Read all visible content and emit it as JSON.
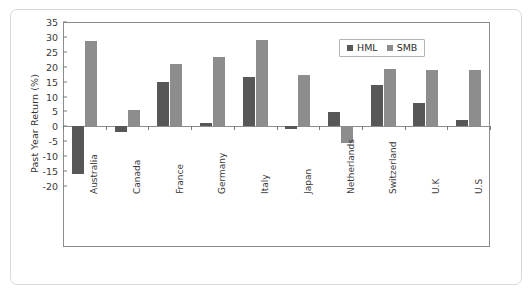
{
  "chart_data": {
    "type": "bar",
    "title": "",
    "xlabel": "",
    "ylabel": "Past Year Return (%)",
    "ylim": [
      -20,
      35
    ],
    "ytick_step": 5,
    "yticks": [
      35,
      30,
      25,
      20,
      15,
      10,
      5,
      0,
      -5,
      -10,
      -15,
      -20
    ],
    "grid": false,
    "legend_position": "top-right",
    "categories": [
      "Australia",
      "Canada",
      "France",
      "Germany",
      "Italy",
      "Japan",
      "Netherlands",
      "Switzerland",
      "U.K",
      "U.S"
    ],
    "series": [
      {
        "name": "HML",
        "color": "#575757",
        "values": [
          -16.1,
          -2.0,
          14.8,
          1.0,
          16.6,
          -1.0,
          4.7,
          14.0,
          8.0,
          2.3
        ]
      },
      {
        "name": "SMB",
        "color": "#8d8d8d",
        "values": [
          28.7,
          5.6,
          20.8,
          23.4,
          28.8,
          17.3,
          -5.5,
          19.3,
          19.0,
          19.0
        ]
      }
    ]
  },
  "legend": {
    "entries": [
      {
        "label": "HML"
      },
      {
        "label": "SMB"
      }
    ]
  },
  "colors": {
    "hml": "#575757",
    "smb": "#8d8d8d",
    "axis": "#8d8d8d",
    "text": "#333333",
    "card_border": "#d8d8d8"
  }
}
